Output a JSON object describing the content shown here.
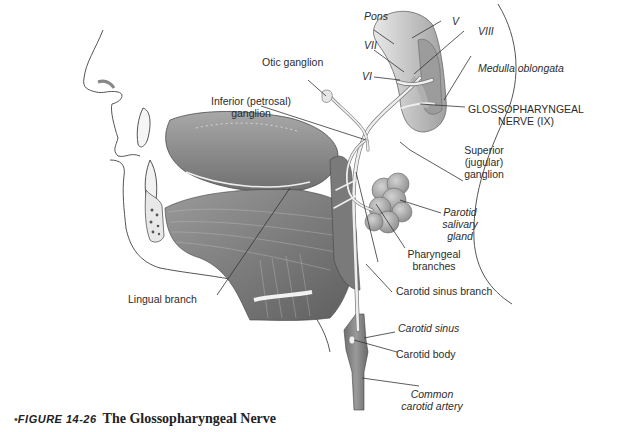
{
  "figure": {
    "caption_bullet": "•",
    "caption_number": "FIGURE 14-26",
    "caption_title": "The Glossopharyngeal Nerve"
  },
  "labels": {
    "pons": "Pons",
    "v": "V",
    "vii": "VII",
    "viii": "VIII",
    "vi": "VI",
    "medulla": "Medulla oblongata",
    "otic_ganglion": "Otic ganglion",
    "inferior_ganglion_line1": "Inferior (petrosal)",
    "inferior_ganglion_line2": "ganglion",
    "glosso_line1": "GLOSSOPHARYNGEAL",
    "glosso_line2": "NERVE (IX)",
    "superior_line1": "Superior",
    "superior_line2": "(jugular)",
    "superior_line3": "ganglion",
    "parotid_line1": "Parotid",
    "parotid_line2": "salivary",
    "parotid_line3": "gland",
    "pharyngeal_line1": "Pharyngeal",
    "pharyngeal_line2": "branches",
    "lingual_branch": "Lingual branch",
    "carotid_sinus_branch": "Carotid sinus branch",
    "carotid_sinus": "Carotid sinus",
    "carotid_body": "Carotid body",
    "common_carotid_line1": "Common",
    "common_carotid_line2": "carotid artery"
  },
  "colors": {
    "tissue": "#8a8a8a",
    "tissue_light": "#b9b9b9",
    "nerve": "#e6e6e6",
    "outline": "#555555",
    "leader": "#333333"
  }
}
